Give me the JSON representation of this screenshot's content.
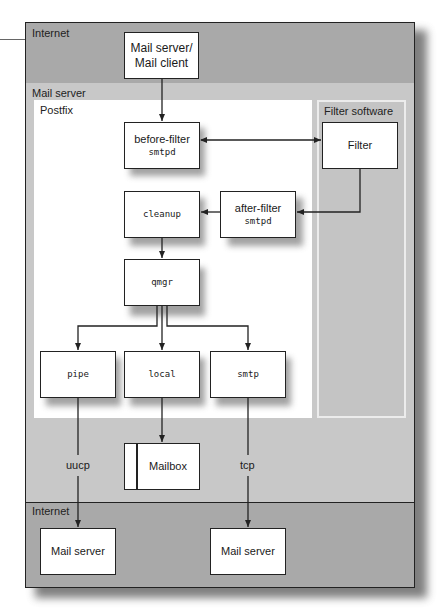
{
  "diagram": {
    "zones": {
      "internet_top": "Internet",
      "mail_server": "Mail server",
      "postfix": "Postfix",
      "filter_software": "Filter software",
      "internet_bottom": "Internet"
    },
    "nodes": {
      "mail_client": {
        "line1": "Mail server/",
        "line2": "Mail client"
      },
      "before_filter": {
        "label": "before-filter",
        "sub": "smtpd"
      },
      "filter": {
        "label": "Filter"
      },
      "after_filter": {
        "label": "after-filter",
        "sub": "smtpd"
      },
      "cleanup": {
        "label": "cleanup"
      },
      "qmgr": {
        "label": "qmgr"
      },
      "pipe": {
        "label": "pipe"
      },
      "local": {
        "label": "local"
      },
      "smtp": {
        "label": "smtp"
      },
      "mailbox": {
        "label": "Mailbox"
      },
      "mail_server_left": {
        "label": "Mail server"
      },
      "mail_server_right": {
        "label": "Mail server"
      }
    },
    "connections": {
      "uucp": "uucp",
      "tcp": "tcp"
    },
    "edges": [
      {
        "from": "mail_client",
        "to": "before_filter"
      },
      {
        "from": "before_filter",
        "to": "filter",
        "bidirectional": true
      },
      {
        "from": "filter",
        "to": "after_filter"
      },
      {
        "from": "after_filter",
        "to": "cleanup"
      },
      {
        "from": "cleanup",
        "to": "qmgr"
      },
      {
        "from": "qmgr",
        "to": "pipe"
      },
      {
        "from": "qmgr",
        "to": "local"
      },
      {
        "from": "qmgr",
        "to": "smtp"
      },
      {
        "from": "local",
        "to": "mailbox"
      },
      {
        "from": "pipe",
        "to": "mail_server_left",
        "label": "uucp"
      },
      {
        "from": "smtp",
        "to": "mail_server_right",
        "label": "tcp"
      }
    ],
    "colors": {
      "internet_zone": "#a9a9a9",
      "mail_server_zone": "#c8c8c8",
      "postfix_area": "#ffffff",
      "filter_area": "#c4c4c4",
      "line": "#222222"
    }
  }
}
